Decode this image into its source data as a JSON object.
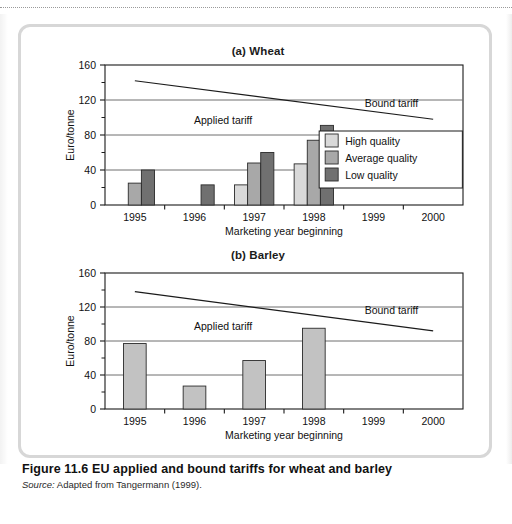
{
  "figure": {
    "caption": "Figure 11.6  EU applied and bound tariffs for wheat and barley",
    "source_label": "Source:",
    "source_text": " Adapted from Tangermann (1999)."
  },
  "colors": {
    "high_quality": "#d9d9d9",
    "average_quality": "#a8a8a8",
    "low_quality": "#707070",
    "barley_bar": "#c2c2c2",
    "bar_outline": "#2b2b2b",
    "gridline": "#6e6e6e",
    "axis": "#1b1b1b",
    "panel_border": "#d7d7d7",
    "text": "#111111"
  },
  "chart_data": [
    {
      "type": "bar",
      "id": "wheat",
      "title": "(a) Wheat",
      "xlabel": "Marketing year beginning",
      "ylabel": "Euro/tonne",
      "categories": [
        "1995",
        "1996",
        "1997",
        "1998",
        "1999",
        "2000"
      ],
      "ylim": [
        0,
        160
      ],
      "yticks": [
        0,
        40,
        80,
        120,
        160
      ],
      "yminorticks": [
        20,
        60,
        100,
        140
      ],
      "grid": true,
      "legend_position": "inside-right",
      "series": [
        {
          "name": "High quality",
          "color": "#d9d9d9",
          "values": [
            null,
            null,
            23,
            47,
            null,
            null
          ]
        },
        {
          "name": "Average quality",
          "color": "#a8a8a8",
          "values": [
            25,
            null,
            48,
            74,
            null,
            null
          ]
        },
        {
          "name": "Low quality",
          "color": "#707070",
          "values": [
            40,
            23,
            60,
            91,
            null,
            null
          ]
        }
      ],
      "lines": [
        {
          "name": "Bound tariff",
          "label": "Bound tariff",
          "x_start": "1995",
          "x_end": "2000",
          "y_start": 142,
          "y_end": 98,
          "label_x_frac": 0.8,
          "label_y": 112
        }
      ],
      "annotations": [
        {
          "name": "Applied tariff",
          "text": "Applied tariff",
          "x_frac": 0.33,
          "y": 93
        }
      ]
    },
    {
      "type": "bar",
      "id": "barley",
      "title": "(b) Barley",
      "xlabel": "Marketing year beginning",
      "ylabel": "Euro/tonne",
      "categories": [
        "1995",
        "1996",
        "1997",
        "1998",
        "1999",
        "2000"
      ],
      "ylim": [
        0,
        160
      ],
      "yticks": [
        0,
        40,
        80,
        120,
        160
      ],
      "yminorticks": [
        20,
        60,
        100,
        140
      ],
      "grid": true,
      "legend_position": "none",
      "series": [
        {
          "name": "Applied tariff",
          "color": "#c2c2c2",
          "values": [
            77,
            27,
            57,
            95,
            null,
            null
          ]
        }
      ],
      "lines": [
        {
          "name": "Bound tariff",
          "label": "Bound tariff",
          "x_start": "1995",
          "x_end": "2000",
          "y_start": 138,
          "y_end": 92,
          "label_x_frac": 0.8,
          "label_y": 112
        }
      ],
      "annotations": [
        {
          "name": "Applied tariff",
          "text": "Applied tariff",
          "x_frac": 0.33,
          "y": 93
        }
      ]
    }
  ]
}
